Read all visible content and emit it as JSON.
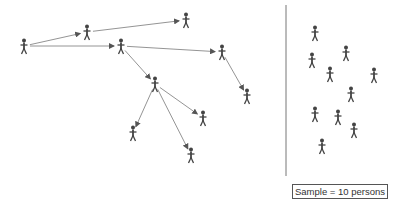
{
  "diagram": {
    "type": "sampling-comparison",
    "colors": {
      "figure": "#444444",
      "arrow": "#888888",
      "divider": "#777777",
      "text": "#333333"
    },
    "network_sample": {
      "persons": [
        {
          "id": "A",
          "x": 24,
          "y": 46
        },
        {
          "id": "B",
          "x": 87,
          "y": 32
        },
        {
          "id": "C",
          "x": 121,
          "y": 46
        },
        {
          "id": "D",
          "x": 186,
          "y": 20
        },
        {
          "id": "E",
          "x": 222,
          "y": 52
        },
        {
          "id": "F",
          "x": 247,
          "y": 96
        },
        {
          "id": "G",
          "x": 155,
          "y": 84
        },
        {
          "id": "H",
          "x": 203,
          "y": 118
        },
        {
          "id": "I",
          "x": 133,
          "y": 133
        },
        {
          "id": "J",
          "x": 191,
          "y": 155
        }
      ],
      "arrows": [
        {
          "from": "A",
          "to": "B"
        },
        {
          "from": "A",
          "to": "C"
        },
        {
          "from": "B",
          "to": "D"
        },
        {
          "from": "C",
          "to": "E"
        },
        {
          "from": "C",
          "to": "G"
        },
        {
          "from": "E",
          "to": "F"
        },
        {
          "from": "G",
          "to": "H"
        },
        {
          "from": "G",
          "to": "I"
        },
        {
          "from": "G",
          "to": "J"
        }
      ]
    },
    "random_sample": {
      "persons": [
        {
          "x": 315,
          "y": 33
        },
        {
          "x": 346,
          "y": 53
        },
        {
          "x": 312,
          "y": 60
        },
        {
          "x": 330,
          "y": 74
        },
        {
          "x": 374,
          "y": 75
        },
        {
          "x": 351,
          "y": 94
        },
        {
          "x": 315,
          "y": 114
        },
        {
          "x": 338,
          "y": 117
        },
        {
          "x": 354,
          "y": 130
        },
        {
          "x": 322,
          "y": 146
        }
      ]
    },
    "divider": {
      "x": 286,
      "y1": 5,
      "y2": 176
    },
    "legend": {
      "label": "Sample = 10 persons"
    }
  }
}
